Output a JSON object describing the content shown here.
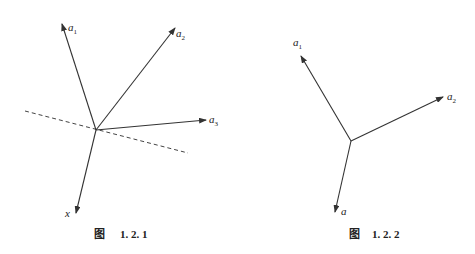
{
  "figures": [
    {
      "id": "fig-1-2-1",
      "caption_prefix": "图",
      "caption_number": "1. 2. 1",
      "labels": {
        "a1": {
          "base": "a",
          "sub": "1"
        },
        "a2": {
          "base": "a",
          "sub": "2"
        },
        "a3": {
          "base": "a",
          "sub": "3"
        },
        "x": {
          "base": "x",
          "sub": ""
        }
      }
    },
    {
      "id": "fig-1-2-2",
      "caption_prefix": "图",
      "caption_number": "1. 2. 2",
      "labels": {
        "a1": {
          "base": "a",
          "sub": "1"
        },
        "a2": {
          "base": "a",
          "sub": "2"
        },
        "a": {
          "base": "a",
          "sub": ""
        }
      }
    }
  ],
  "colors": {
    "line": "#333333",
    "background": "#ffffff"
  }
}
